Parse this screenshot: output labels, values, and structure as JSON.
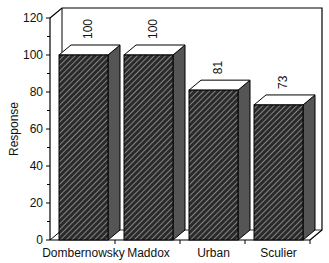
{
  "chart_data": {
    "type": "bar",
    "style": "3d",
    "title": "",
    "xlabel": "",
    "ylabel": "Response",
    "categories": [
      "Dombernowsky",
      "Maddox",
      "Urban",
      "Sculier"
    ],
    "values": [
      100,
      100,
      81,
      73
    ],
    "data_labels": [
      "100",
      "100",
      "81",
      "73"
    ],
    "ylim": [
      0,
      120
    ],
    "yticks": [
      0,
      20,
      40,
      60,
      80,
      100,
      120
    ],
    "grid": false,
    "legend": null,
    "colors": {
      "bar_front": "#333333",
      "bar_side": "#555555",
      "bar_top": "#ffffff",
      "axis": "#000000"
    }
  }
}
